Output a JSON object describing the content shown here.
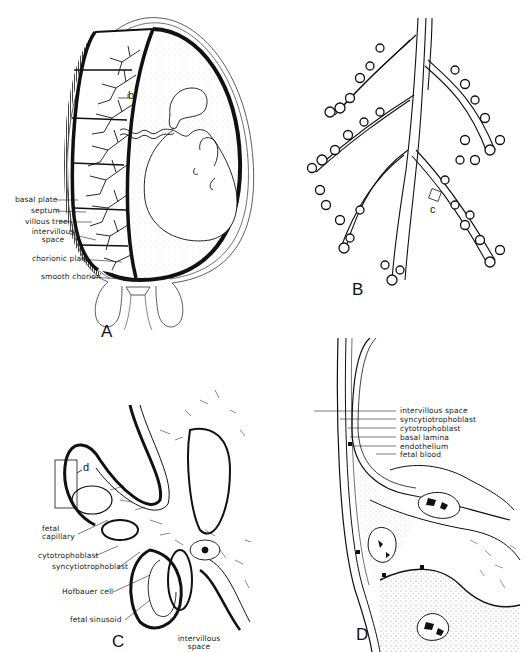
{
  "figure": {
    "panels": [
      {
        "id": "A",
        "letter": "A",
        "description": "Pregnant uterus with embryo in chorionic sac and placenta",
        "callout": "b",
        "labels": [
          "basal plate",
          "septum",
          "villous tree",
          "intervillous space",
          "chorionic plate",
          "smooth chorion"
        ]
      },
      {
        "id": "B",
        "letter": "B",
        "description": "Villous tree branching",
        "callout": "c"
      },
      {
        "id": "C",
        "letter": "C",
        "description": "Section through villi",
        "callout": "d",
        "labels": [
          "fetal capillary",
          "cytotrophoblast",
          "syncytiotrophoblast",
          "Hofbauer cell",
          "fetal sinusoid",
          "intervillous space"
        ]
      },
      {
        "id": "D",
        "letter": "D",
        "description": "Placental barrier detail",
        "labels": [
          "intervillous space",
          "syncytiotrophoblast",
          "cytotrophoblast",
          "basal lamina",
          "endothelium",
          "fetal blood"
        ]
      }
    ]
  },
  "panelA": {
    "letter": "A",
    "callout": "b",
    "labels": {
      "basal_plate": "basal plate",
      "septum": "septum",
      "villous_tree": "villous tree",
      "intervillous_1": "intervillous",
      "intervillous_2": "space",
      "chorionic_plate": "chorionic plate",
      "smooth_chorion": "smooth chorion"
    }
  },
  "panelB": {
    "letter": "B",
    "callout": "c"
  },
  "panelC": {
    "letter": "C",
    "callout": "d",
    "labels": {
      "fetal_capillary_1": "fetal",
      "fetal_capillary_2": "capillary",
      "cytotrophoblast": "cytotrophoblast",
      "syncytiotrophoblast": "syncytiotrophoblast",
      "hofbauer": "Hofbauer  cell",
      "fetal_sinusoid": "fetal sinusoid",
      "intervillous_1": "intervillous",
      "intervillous_2": "space"
    }
  },
  "panelD": {
    "letter": "D",
    "labels": {
      "intervillous_space": "intervillous space",
      "syncytiotrophoblast": "syncytiotrophoblast",
      "cytotrophoblast": "cytotrophoblast",
      "basal_lamina": "basal lamina",
      "endothelium": "endothelium",
      "fetal_blood": "fetal blood"
    }
  }
}
